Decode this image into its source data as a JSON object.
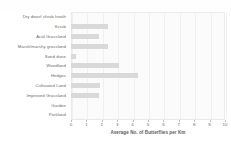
{
  "chart_data": {
    "type": "bar",
    "orientation": "horizontal",
    "title": "",
    "xlabel": "Average No. of Butterflies per Km",
    "ylabel": "",
    "xlim": [
      0,
      10
    ],
    "xticks": [
      "0",
      "1",
      "2",
      "3",
      "4",
      "5",
      "6",
      "7",
      "8",
      "9",
      "10"
    ],
    "grid": true,
    "legend": "none",
    "bar_color": "#d9d9d9",
    "categories": [
      "Dry dwarf shrub heath",
      "Scrub",
      "Acid Grassland",
      "Marsh/marshy grassland",
      "Sand dune",
      "Woodland",
      "Hedges",
      "Cultivated Land",
      "Improved Grassland",
      "Garden",
      "Parkland"
    ],
    "values": [
      0,
      2.4,
      1.8,
      2.4,
      0.35,
      3.1,
      4.35,
      1.9,
      1.85,
      0,
      0
    ]
  },
  "figure": {
    "background_color": "#ffffff",
    "plot_background_color": "#fbfbfb",
    "axis_color": "#e9e9e9",
    "text_color": "#6b6b6b"
  }
}
